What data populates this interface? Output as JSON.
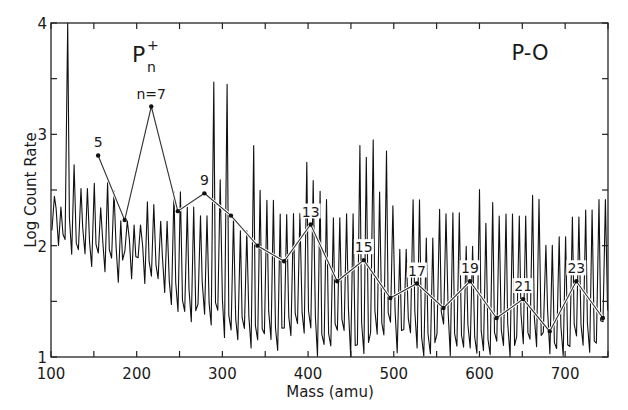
{
  "chart_data": {
    "type": "line",
    "title": "",
    "annotations": {
      "species_label": "P",
      "species_sup": "+",
      "species_sub": "n",
      "sample_label": "P-O"
    },
    "xlabel": "Mass (amu)",
    "ylabel": "Log Count Rate",
    "xlim": [
      100,
      750
    ],
    "ylim": [
      1,
      4
    ],
    "x_ticks": [
      100,
      200,
      300,
      400,
      500,
      600,
      700
    ],
    "y_ticks": [
      1,
      2,
      3,
      4
    ],
    "grid": false,
    "legend": null,
    "series": [
      {
        "name": "P_n+ cluster envelope",
        "points": [
          {
            "n": 5,
            "mass": 155,
            "value": 2.81,
            "label": "5"
          },
          {
            "n": 6,
            "mass": 186,
            "value": 2.23,
            "label": ""
          },
          {
            "n": 7,
            "mass": 217,
            "value": 3.25,
            "label": "n=7"
          },
          {
            "n": 8,
            "mass": 248,
            "value": 2.31,
            "label": ""
          },
          {
            "n": 9,
            "mass": 279,
            "value": 2.47,
            "label": "9"
          },
          {
            "n": 10,
            "mass": 310,
            "value": 2.27,
            "label": ""
          },
          {
            "n": 11,
            "mass": 341,
            "value": 2.0,
            "label": ""
          },
          {
            "n": 12,
            "mass": 372,
            "value": 1.86,
            "label": ""
          },
          {
            "n": 13,
            "mass": 403,
            "value": 2.19,
            "label": "13"
          },
          {
            "n": 14,
            "mass": 434,
            "value": 1.68,
            "label": ""
          },
          {
            "n": 15,
            "mass": 465,
            "value": 1.87,
            "label": "15"
          },
          {
            "n": 16,
            "mass": 496,
            "value": 1.53,
            "label": ""
          },
          {
            "n": 17,
            "mass": 527,
            "value": 1.66,
            "label": "17"
          },
          {
            "n": 18,
            "mass": 558,
            "value": 1.44,
            "label": ""
          },
          {
            "n": 19,
            "mass": 589,
            "value": 1.68,
            "label": "19"
          },
          {
            "n": 20,
            "mass": 620,
            "value": 1.35,
            "label": ""
          },
          {
            "n": 21,
            "mass": 651,
            "value": 1.52,
            "label": "21"
          },
          {
            "n": 22,
            "mass": 682,
            "value": 1.23,
            "label": ""
          },
          {
            "n": 23,
            "mass": 713,
            "value": 1.68,
            "label": "23"
          },
          {
            "n": 24,
            "mass": 744,
            "value": 1.35,
            "label": ""
          }
        ]
      },
      {
        "name": "raw mass spectrum",
        "description": "dense spiky spectrum with peaks every ~16 amu; strongest at ~124 amu (reaching 4); baseline decays from ~2 near 100 amu to ~1 beyond 300 amu",
        "strong_peaks": [
          {
            "mass": 124,
            "value": 4.0
          },
          {
            "mass": 285,
            "value": 3.47
          },
          {
            "mass": 300,
            "value": 3.45
          },
          {
            "mass": 333,
            "value": 2.9
          },
          {
            "mass": 460,
            "value": 2.9
          },
          {
            "mass": 474,
            "value": 2.95
          },
          {
            "mass": 488,
            "value": 2.85
          }
        ]
      }
    ]
  }
}
